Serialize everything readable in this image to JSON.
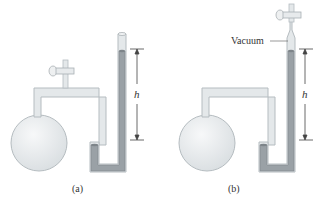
{
  "figure": {
    "panels": [
      {
        "id": "a",
        "caption": "(a)",
        "height_label": "h",
        "description": "Flask with stopcock on top connected to U-tube manometer open at top"
      },
      {
        "id": "b",
        "caption": "(b)",
        "height_label": "h",
        "top_label": "Vacuum",
        "description": "Flask connected to closed-end U-tube manometer with stopcock at top and vacuum above liquid"
      }
    ],
    "colors": {
      "glass": "#e4e8ea",
      "glass_edge": "#b5bcc0",
      "liquid": "#9aa1a6",
      "liquid_edge": "#7e858a",
      "arrow": "#444444"
    }
  }
}
